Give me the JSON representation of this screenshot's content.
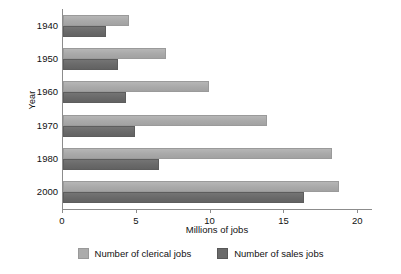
{
  "chart_data": {
    "type": "bar",
    "orientation": "horizontal",
    "title": "",
    "xlabel": "Millions of jobs",
    "ylabel": "Year",
    "categories": [
      "1940",
      "1950",
      "1960",
      "1970",
      "1980",
      "2000"
    ],
    "series": [
      {
        "name": "Number of clerical jobs",
        "color": "#ababab",
        "values": [
          4.5,
          7.0,
          9.9,
          13.8,
          18.2,
          18.7
        ]
      },
      {
        "name": "Number of sales jobs",
        "color": "#6a6a6a",
        "values": [
          2.9,
          3.7,
          4.3,
          4.9,
          6.5,
          16.3
        ]
      }
    ],
    "xlim": [
      0,
      21
    ],
    "xticks": [
      0,
      5,
      10,
      15,
      20
    ],
    "xtick_labels": [
      "0",
      "5",
      "10",
      "15",
      "20"
    ],
    "grid": false,
    "legend_position": "bottom"
  },
  "axes": {
    "y_title": "Year",
    "x_title": "Millions of jobs"
  },
  "legend": {
    "items": [
      {
        "label": "Number of clerical jobs",
        "swatch": "clerical"
      },
      {
        "label": "Number of sales jobs",
        "swatch": "sales"
      }
    ]
  }
}
